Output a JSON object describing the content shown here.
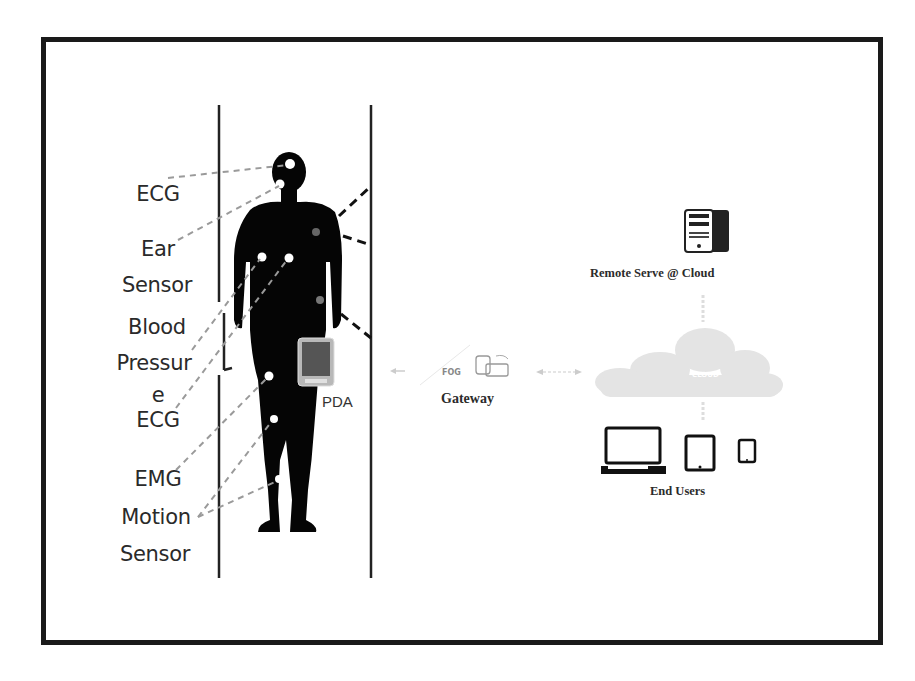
{
  "diagram": {
    "sensor_labels": [
      {
        "id": "ecg-head",
        "text": "ECG"
      },
      {
        "id": "ear-sensor-1",
        "text": "Ear"
      },
      {
        "id": "ear-sensor-2",
        "text": "Sensor"
      },
      {
        "id": "blood-pressure-1",
        "text": "Blood"
      },
      {
        "id": "blood-pressure-2",
        "text": "Pressur"
      },
      {
        "id": "blood-pressure-3",
        "text": "e"
      },
      {
        "id": "ecg-body",
        "text": "ECG"
      },
      {
        "id": "emg",
        "text": "EMG"
      },
      {
        "id": "motion-sensor-1",
        "text": "Motion"
      },
      {
        "id": "motion-sensor-2",
        "text": "Sensor"
      }
    ],
    "device_label": "PDA",
    "gateway": {
      "icon_text": "FOG",
      "label": "Gateway"
    },
    "server": {
      "label": "Remote Serve @ Cloud"
    },
    "cloud": {
      "icon_text": "CLOUD"
    },
    "end_users": {
      "label": "End Users",
      "devices": [
        "laptop",
        "tablet",
        "phone"
      ]
    },
    "colors": {
      "frame": "#1a1a1a",
      "silhouette": "#050505",
      "sensor_dot": "#ffffff",
      "dashed_line": "#9a9a9a",
      "cloud": "#e6e6e6"
    }
  }
}
